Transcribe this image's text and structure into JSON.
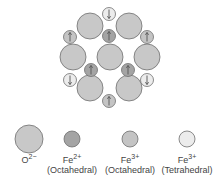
{
  "colors": {
    "oxygen": "#c8c8c8",
    "fe2_oct": "#a4a4a4",
    "fe3_oct": "#c4c4c4",
    "fe3_tet": "#ececec",
    "stroke": "#6e6e6e"
  },
  "structure": {
    "oxygen": [
      [
        90,
        26
      ],
      [
        129,
        26
      ],
      [
        73,
        57
      ],
      [
        110,
        57
      ],
      [
        147,
        57
      ],
      [
        90,
        88
      ],
      [
        129,
        88
      ]
    ],
    "fe2_oct": [
      {
        "x": 109,
        "y": 36,
        "spin": "up"
      },
      {
        "x": 91,
        "y": 70,
        "spin": "up"
      },
      {
        "x": 128,
        "y": 70,
        "spin": "up"
      }
    ],
    "fe3_oct": [
      {
        "x": 70,
        "y": 37,
        "spin": "up"
      },
      {
        "x": 147,
        "y": 37,
        "spin": "up"
      },
      {
        "x": 109,
        "y": 101,
        "spin": "up"
      }
    ],
    "fe3_tet": [
      {
        "x": 109,
        "y": 14,
        "spin": "down"
      },
      {
        "x": 70,
        "y": 80,
        "spin": "down"
      },
      {
        "x": 147,
        "y": 80,
        "spin": "down"
      }
    ]
  },
  "legend": [
    {
      "ion": "O",
      "charge": "2−",
      "site": "",
      "key": "oxygen"
    },
    {
      "ion": "Fe",
      "charge": "2+",
      "site": "(Octahedral)",
      "key": "fe2_oct"
    },
    {
      "ion": "Fe",
      "charge": "3+",
      "site": "(Octahedral)",
      "key": "fe3_oct"
    },
    {
      "ion": "Fe",
      "charge": "3+",
      "site": "(Tetrahedral)",
      "key": "fe3_tet"
    }
  ]
}
